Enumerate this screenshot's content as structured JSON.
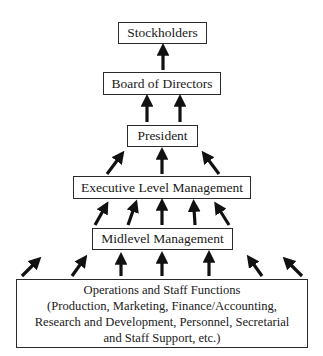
{
  "diagram": {
    "type": "organizational-hierarchy",
    "levels": [
      {
        "id": "stockholders",
        "label": "Stockholders"
      },
      {
        "id": "board",
        "label": "Board of Directors"
      },
      {
        "id": "president",
        "label": "President"
      },
      {
        "id": "executive",
        "label": "Executive Level Management"
      },
      {
        "id": "midlevel",
        "label": "Midlevel Management"
      },
      {
        "id": "operations",
        "label": "Operations and Staff Functions",
        "lines": [
          "Operations and Staff Functions",
          "(Production, Marketing, Finance/Accounting,",
          "Research and Development, Personnel, Secretarial",
          "and Staff Support, etc.)"
        ]
      }
    ],
    "arrow_counts": {
      "board_to_stockholders": 1,
      "president_to_board": 2,
      "executive_to_president": 3,
      "midlevel_to_executive": 5,
      "operations_to_midlevel": 7
    },
    "colors": {
      "line": "#2a2a2a",
      "arrow": "#111111",
      "background": "#ffffff"
    }
  }
}
